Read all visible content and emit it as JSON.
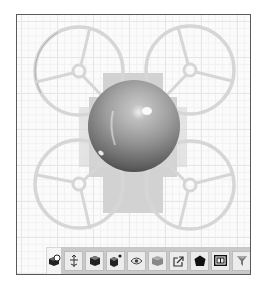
{
  "viewport": {
    "background": "#fbfbfb",
    "grid_major_color": "#e6e6e6",
    "grid_minor_color": "#f1f1f1",
    "border_color": "#5a5a5a"
  },
  "model": {
    "name": "quadcopter-drone",
    "frame_color": "#d9d9d9",
    "body_plate_color": "#cfcfcf",
    "dome_color": "#8c8c8c",
    "rotor_guards": [
      {
        "position": "top-left",
        "hub": [
          62,
          56
        ]
      },
      {
        "position": "top-right",
        "hub": [
          173,
          55
        ]
      },
      {
        "position": "bottom-left",
        "hub": [
          62,
          169
        ]
      },
      {
        "position": "bottom-right",
        "hub": [
          173,
          170
        ]
      }
    ]
  },
  "toolbar": {
    "primary": {
      "icon": "view-cube-icon",
      "label": "View"
    },
    "buttons": [
      {
        "icon": "move-axis-icon",
        "label": "Move"
      },
      {
        "icon": "solid-cube-icon",
        "label": "Solid"
      },
      {
        "icon": "cube-add-icon",
        "label": "Add object"
      },
      {
        "icon": "eye-icon",
        "label": "Visibility"
      },
      {
        "icon": "layers-icon",
        "label": "Layers"
      },
      {
        "icon": "export-icon",
        "label": "Export"
      },
      {
        "icon": "polyhedron-icon",
        "label": "Shape"
      },
      {
        "icon": "frame-icon",
        "label": "Frame"
      },
      {
        "icon": "filter-icon",
        "label": "Filter"
      }
    ]
  }
}
